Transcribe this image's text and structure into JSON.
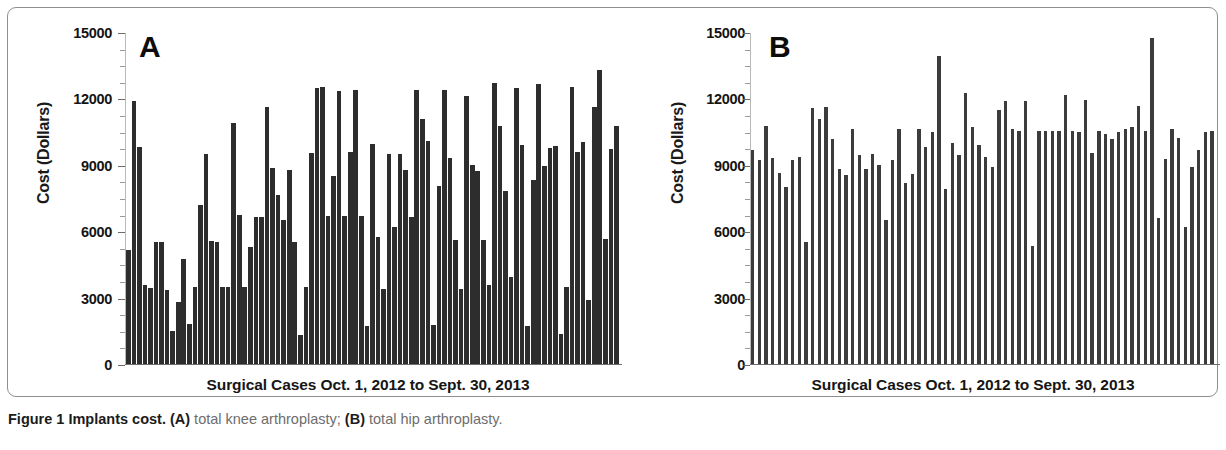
{
  "figure": {
    "caption_title": "Figure 1 Implants cost.",
    "caption_a_marker": "(A)",
    "caption_a_text": " total knee arthroplasty; ",
    "caption_b_marker": "(B)",
    "caption_b_text": " total hip arthroplasty."
  },
  "panels": {
    "a": {
      "letter": "A",
      "ylabel": "Cost (Dollars)",
      "xlabel": "Surgical Cases Oct. 1, 2012 to Sept. 30, 2013",
      "yticks": [
        "0",
        "3000",
        "6000",
        "9000",
        "12000",
        "15000"
      ]
    },
    "b": {
      "letter": "B",
      "ylabel": "Cost (Dollars)",
      "xlabel": "Surgical Cases Oct. 1, 2012 to  Sept. 30, 2013",
      "yticks": [
        "0",
        "3000",
        "6000",
        "9000",
        "12000",
        "15000"
      ]
    }
  },
  "chart_data": [
    {
      "type": "bar",
      "id": "panel-a",
      "title": "A",
      "subtitle": "total knee arthroplasty",
      "xlabel": "Surgical Cases Oct. 1, 2012 to Sept. 30, 2013",
      "ylabel": "Cost (Dollars)",
      "ylim": [
        0,
        15000
      ],
      "yticks": [
        0,
        3000,
        6000,
        9000,
        12000,
        15000
      ],
      "grid": false,
      "legend": "none",
      "bar_color": "#2d2d2d",
      "categories": [],
      "values": [
        5150,
        11900,
        9800,
        3550,
        3450,
        5500,
        5500,
        3350,
        1500,
        2800,
        4750,
        1800,
        3500,
        7200,
        9500,
        5550,
        5500,
        3500,
        3500,
        10900,
        6750,
        3500,
        5300,
        6650,
        6650,
        11600,
        8850,
        7650,
        6500,
        8750,
        5500,
        1300,
        3500,
        9550,
        12450,
        12500,
        6700,
        8500,
        12350,
        6700,
        9600,
        12400,
        6700,
        1700,
        9950,
        5750,
        3400,
        9500,
        6200,
        9500,
        8750,
        6650,
        12400,
        11050,
        10100,
        1750,
        8050,
        12400,
        9300,
        5600,
        3400,
        12100,
        9000,
        8700,
        5600,
        3550,
        12700,
        10750,
        7800,
        3950,
        12450,
        9900,
        1700,
        8300,
        12650,
        8950,
        9750,
        9850,
        1350,
        3500,
        12500,
        9600,
        10050,
        2900,
        11600,
        13300,
        5650,
        9700,
        10750
      ]
    },
    {
      "type": "bar",
      "id": "panel-b",
      "title": "B",
      "subtitle": "total hip arthroplasty",
      "xlabel": "Surgical Cases Oct. 1, 2012 to  Sept. 30, 2013",
      "ylabel": "Cost (Dollars)",
      "ylim": [
        0,
        15000
      ],
      "yticks": [
        0,
        3000,
        6000,
        9000,
        12000,
        15000
      ],
      "grid": false,
      "legend": "none",
      "bar_color": "#3c3c3c",
      "categories": [],
      "values": [
        9650,
        9200,
        10750,
        9300,
        8650,
        8000,
        9200,
        9350,
        5500,
        11550,
        11050,
        11600,
        10150,
        8800,
        8550,
        10600,
        9450,
        8800,
        9500,
        9000,
        6500,
        9200,
        10600,
        8200,
        8600,
        10600,
        9800,
        10500,
        13900,
        7900,
        10000,
        9450,
        12250,
        10700,
        9900,
        9350,
        8900,
        11500,
        11900,
        10600,
        10550,
        11900,
        5350,
        10550,
        10550,
        10550,
        10550,
        12150,
        10550,
        10500,
        11950,
        9550,
        10550,
        10400,
        10150,
        10500,
        10600,
        10700,
        11650,
        10550,
        14750,
        6600,
        9250,
        10600,
        10200,
        6200,
        8900,
        9650,
        10500,
        10550
      ]
    }
  ]
}
